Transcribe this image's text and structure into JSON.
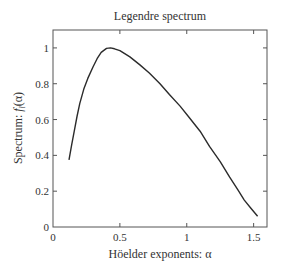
{
  "chart_data": {
    "type": "line",
    "title": "Legendre spectrum",
    "xlabel": "Höelder exponents: α",
    "ylabel": {
      "prefix": "Spectrum: ",
      "symbol": "f",
      "subscript": "l",
      "suffix": "(α)"
    },
    "xlim": [
      0,
      1.6
    ],
    "ylim": [
      0,
      1.1
    ],
    "xticks": [
      0,
      0.5,
      1,
      1.5
    ],
    "xtick_labels": [
      "0",
      "0.5",
      "1",
      "1.5"
    ],
    "yticks": [
      0,
      0.2,
      0.4,
      0.6,
      0.8,
      1
    ],
    "ytick_labels": [
      "0",
      "0.2",
      "0.4",
      "0.6",
      "0.8",
      "1"
    ],
    "grid": false,
    "legend": null,
    "series": [
      {
        "name": "Legendre spectrum",
        "color": "#2b2b2b",
        "x": [
          0.12,
          0.14,
          0.16,
          0.18,
          0.2,
          0.23,
          0.26,
          0.3,
          0.33,
          0.36,
          0.4,
          0.43,
          0.46,
          0.5,
          0.575,
          0.65,
          0.72,
          0.8,
          0.87,
          0.95,
          1.02,
          1.1,
          1.17,
          1.25,
          1.32,
          1.38,
          1.43,
          1.48,
          1.53
        ],
        "y": [
          0.375,
          0.46,
          0.54,
          0.62,
          0.69,
          0.77,
          0.83,
          0.895,
          0.94,
          0.975,
          0.997,
          1.0,
          0.995,
          0.985,
          0.95,
          0.905,
          0.86,
          0.8,
          0.74,
          0.675,
          0.61,
          0.535,
          0.45,
          0.365,
          0.28,
          0.21,
          0.15,
          0.105,
          0.06
        ]
      }
    ]
  }
}
